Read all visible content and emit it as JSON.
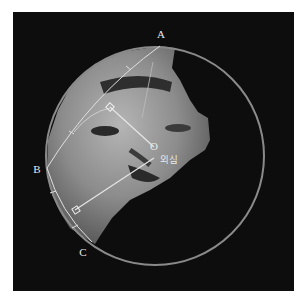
{
  "figure": {
    "background_color": "#0d0d0d",
    "circle_color": "#8a8a8a",
    "line_color": "#e0e0e0"
  },
  "labels": {
    "point_a": "A",
    "point_b": "B",
    "point_c": "C",
    "point_o": "O",
    "circumcenter": "외심"
  },
  "geometry": {
    "circle": {
      "cx": 155,
      "cy": 156,
      "r": 109
    },
    "A": [
      161,
      46
    ],
    "B": [
      47,
      168
    ],
    "C": [
      92,
      242
    ],
    "O": [
      154,
      147
    ]
  }
}
